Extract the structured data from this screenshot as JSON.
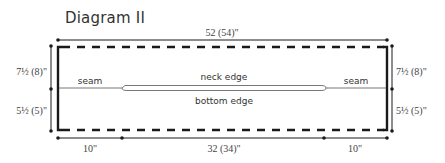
{
  "title": "Diagram II",
  "dimensions": {
    "top_width": "52 (54)\"",
    "left_upper": "7½ (8)\"",
    "left_lower": "5½ (5)\"",
    "right_upper": "7½ (8)\"",
    "right_lower": "5½ (5)\"",
    "bottom_left": "10\"",
    "bottom_middle": "32 (34)\"",
    "bottom_right": "10\""
  },
  "labels": {
    "seam_left": "seam",
    "seam_right": "seam",
    "neck_edge": "neck edge",
    "bottom_edge": "bottom edge"
  },
  "colors": {
    "line": "#1a1a1a",
    "text": "#333333"
  }
}
